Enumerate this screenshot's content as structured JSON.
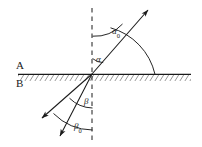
{
  "figure": {
    "background_color": "#ffffff",
    "line_color": "#1a1a1a",
    "width": 202,
    "height": 147,
    "media_labels": {
      "upper": "A",
      "lower": "B"
    },
    "angle_labels": {
      "alpha0": {
        "symbol": "α",
        "subscript": "0"
      },
      "alpha": {
        "symbol": "α",
        "subscript": ""
      },
      "beta": {
        "symbol": "β",
        "subscript": ""
      },
      "beta0": {
        "symbol": "β",
        "subscript": "0"
      }
    },
    "geometry": {
      "incidence_point_x": 92,
      "incidence_point_y": 74,
      "interface_y": 74,
      "normal_line_x": 92,
      "normal_top_y": 8,
      "normal_bottom_y": 143
    },
    "elements": {
      "interface_line": "solid horizontal boundary with hatching below",
      "normal_line": "vertical dashed normal",
      "ray_upper_right": "ray through incidence point toward upper right with arrow",
      "ray_lower_left_inner": "refracted ray toward lower left with arrow",
      "ray_lower_left_outer": "second ray toward lower left with arrow",
      "arc_alpha0": "small arc from normal to upper ray",
      "arc_alpha": "small arc from normal to upper ray near interface",
      "arc_large_right": "large arc from interface to upper ray",
      "arc_beta": "small arc below normal to inner lower ray",
      "arc_beta0": "arc below normal to outer lower ray"
    }
  }
}
